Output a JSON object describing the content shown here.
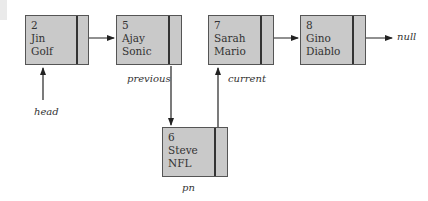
{
  "diagram": {
    "type": "linked-list-insertion",
    "nodes": [
      {
        "id": "n2",
        "number": "2",
        "first": "Jin",
        "last": "Golf"
      },
      {
        "id": "n5",
        "number": "5",
        "first": "Ajay",
        "last": "Sonic"
      },
      {
        "id": "n7",
        "number": "7",
        "first": "Sarah",
        "last": "Mario"
      },
      {
        "id": "n8",
        "number": "8",
        "first": "Gino",
        "last": "Diablo"
      },
      {
        "id": "n6",
        "number": "6",
        "first": "Steve",
        "last": "NFL"
      }
    ],
    "labels": {
      "head": "head",
      "previous": "previous",
      "current": "current",
      "pn": "pn",
      "null": "null"
    },
    "edges": [
      {
        "from": "n2",
        "to": "n5"
      },
      {
        "from": "n5",
        "to": "n6"
      },
      {
        "from": "n6",
        "to": "n7"
      },
      {
        "from": "n7",
        "to": "n8"
      },
      {
        "from": "n8",
        "to": "null"
      },
      {
        "from": "head",
        "to": "n2"
      }
    ],
    "colors": {
      "node_fill": "#c9c9c9",
      "node_border": "#555555",
      "line": "#222222"
    }
  }
}
